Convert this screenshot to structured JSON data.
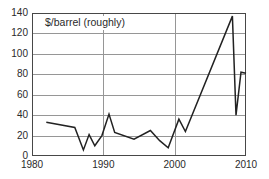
{
  "chart_data": {
    "type": "line",
    "title": "$/barrel (roughly)",
    "xlabel": "",
    "ylabel": "",
    "xlim": [
      1980,
      2010
    ],
    "ylim": [
      0,
      140
    ],
    "x_ticks": [
      1980,
      1990,
      2000,
      2010
    ],
    "y_ticks": [
      0,
      20,
      40,
      60,
      80,
      100,
      120,
      140
    ],
    "grid": {
      "horizontal_every": 20,
      "vertical_at": [
        1990,
        2000
      ]
    },
    "legend": "none",
    "series": [
      {
        "name": "$/barrel (roughly)",
        "points": [
          [
            1982,
            33
          ],
          [
            1986,
            28
          ],
          [
            1987.2,
            6
          ],
          [
            1988,
            21
          ],
          [
            1988.8,
            10
          ],
          [
            1989.8,
            20
          ],
          [
            1990.8,
            41
          ],
          [
            1991.6,
            23
          ],
          [
            1994.3,
            16.5
          ],
          [
            1996.6,
            25
          ],
          [
            1997.9,
            15
          ],
          [
            1999.1,
            8
          ],
          [
            2000.6,
            36
          ],
          [
            2001.5,
            24
          ],
          [
            2008.1,
            137
          ],
          [
            2008.6,
            40
          ],
          [
            2009.3,
            82
          ],
          [
            2010,
            81
          ]
        ]
      }
    ]
  },
  "colors": {
    "line": "#222222",
    "grid": "#969696",
    "frame": "#474747",
    "text": "#2a2a2a",
    "background": "#ffffff"
  }
}
